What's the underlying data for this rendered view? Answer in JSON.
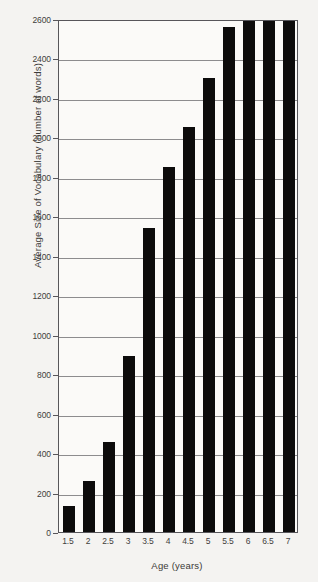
{
  "chart_data": {
    "type": "bar",
    "title": "",
    "subtitle": "",
    "xlabel": "Age (years)",
    "ylabel": "Average Size of Vocabulary (number of words)",
    "categories": [
      "1.5",
      "2",
      "2.5",
      "3",
      "3.5",
      "4",
      "4.5",
      "5",
      "5.5",
      "6",
      "6.5",
      "7"
    ],
    "values": [
      130,
      260,
      455,
      890,
      1540,
      1850,
      2055,
      2300,
      2560,
      2620,
      2620,
      2620
    ],
    "clipped_at_top": [
      false,
      false,
      false,
      false,
      false,
      false,
      false,
      false,
      false,
      true,
      true,
      true
    ],
    "ylim": [
      0,
      2600
    ],
    "ytick_labels": [
      "0",
      "200",
      "400",
      "600",
      "800",
      "1000",
      "1200",
      "1400",
      "1600",
      "1800",
      "2000",
      "2200",
      "2400",
      "2600"
    ],
    "ytick_values": [
      0,
      200,
      400,
      600,
      800,
      1000,
      1200,
      1400,
      1600,
      1800,
      2000,
      2200,
      2400,
      2600
    ],
    "grid": true,
    "grid_axis": "y",
    "legend": false,
    "legend_position": "none",
    "series": [
      {
        "name": "Average Size of Vocabulary",
        "values": [
          130,
          260,
          455,
          890,
          1540,
          1850,
          2055,
          2300,
          2560,
          2620,
          2620,
          2620
        ]
      }
    ],
    "colors": {
      "bar": "#0d0c0c",
      "grid": "#8d8c8e",
      "axis": "#57565a",
      "background": "#f4f3f1",
      "plot_background": "#fbfaf8",
      "text": "#3f3e3c"
    }
  }
}
